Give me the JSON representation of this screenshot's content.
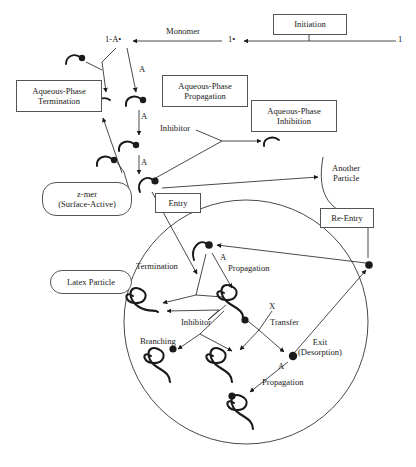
{
  "diagram": {
    "stroke_color": "#1a1a1a",
    "box_border_color": "#555555",
    "background": "#ffffff"
  },
  "boxes": [
    {
      "id": "initiation",
      "label": "Initiation",
      "x": 273,
      "y": 14,
      "w": 72,
      "h": 19,
      "font": 8.6,
      "shape": "rect"
    },
    {
      "id": "aq-term",
      "label": "Aqueous-Phase\nTermination",
      "x": 16,
      "y": 80,
      "w": 84,
      "h": 30,
      "font": 8.6,
      "shape": "rect"
    },
    {
      "id": "aq-prop",
      "label": "Aqueous-Phase\nPropagation",
      "x": 162,
      "y": 75,
      "w": 84,
      "h": 30,
      "font": 8.6,
      "shape": "rect"
    },
    {
      "id": "aq-inhib",
      "label": "Aqueous-Phase\nInhibition",
      "x": 251,
      "y": 100,
      "w": 84,
      "h": 30,
      "font": 8.6,
      "shape": "rect"
    },
    {
      "id": "entry",
      "label": "Entry",
      "x": 155,
      "y": 193,
      "w": 44,
      "h": 18,
      "font": 8.6,
      "shape": "rect"
    },
    {
      "id": "re-entry",
      "label": "Re-Entry",
      "x": 320,
      "y": 208,
      "w": 52,
      "h": 18,
      "font": 8.6,
      "shape": "rect"
    },
    {
      "id": "z-mer",
      "label": "z-mer\n(Surface-Active)",
      "x": 42,
      "y": 182,
      "w": 88,
      "h": 32,
      "font": 8.6,
      "shape": "pill"
    },
    {
      "id": "latex",
      "label": "Latex Particle",
      "x": 50,
      "y": 270,
      "w": 80,
      "h": 22,
      "font": 8.6,
      "shape": "pill"
    }
  ],
  "labels": [
    {
      "id": "monomer",
      "text": "Monomer",
      "x": 166,
      "y": 27,
      "font": 8.6
    },
    {
      "id": "species-1",
      "text": "1",
      "x": 398,
      "y": 41,
      "font": 8.6
    },
    {
      "id": "species-1-rad",
      "text": "1•",
      "x": 228,
      "y": 41,
      "font": 8.6
    },
    {
      "id": "species-1a-rad",
      "text": "1-A•",
      "x": 110,
      "y": 41,
      "font": 8.6
    },
    {
      "id": "mono-a-1",
      "text": "A",
      "x": 139,
      "y": 72,
      "font": 8.6
    },
    {
      "id": "mono-a-2",
      "text": "A",
      "x": 141,
      "y": 116,
      "font": 8.6
    },
    {
      "id": "mono-a-3",
      "text": "A",
      "x": 141,
      "y": 162,
      "font": 8.6
    },
    {
      "id": "inhibitor-aq",
      "text": "Inhibitor",
      "x": 163,
      "y": 128,
      "font": 8.6
    },
    {
      "id": "another-part",
      "text": "Another\nParticle",
      "x": 337,
      "y": 169,
      "font": 8.6
    },
    {
      "id": "termination",
      "text": "Termination",
      "x": 139,
      "y": 266,
      "font": 8.6
    },
    {
      "id": "propagation-1",
      "text": "Propagation",
      "x": 228,
      "y": 268,
      "font": 8.6
    },
    {
      "id": "prop-a-1",
      "text": "A",
      "x": 220,
      "y": 257,
      "font": 8.6
    },
    {
      "id": "inhibitor-part",
      "text": "Inhibitor",
      "x": 185,
      "y": 322,
      "font": 8.6
    },
    {
      "id": "transfer",
      "text": "Transfer",
      "x": 273,
      "y": 322,
      "font": 8.6
    },
    {
      "id": "transfer-x",
      "text": "X",
      "x": 272,
      "y": 307,
      "font": 8.6
    },
    {
      "id": "branching",
      "text": "Branching",
      "x": 144,
      "y": 341,
      "font": 8.6
    },
    {
      "id": "exit",
      "text": "Exit\n(Desorption)",
      "x": 303,
      "y": 343,
      "font": 8.6
    },
    {
      "id": "prop-a-2",
      "text": "A",
      "x": 278,
      "y": 366,
      "font": 8.6
    },
    {
      "id": "propagation-2",
      "text": "Propagation",
      "x": 266,
      "y": 382,
      "font": 8.6
    }
  ],
  "particle": {
    "name": "latex-particle-circle",
    "cx": 246,
    "cy": 322,
    "r": 122
  },
  "another_particle_arc": {
    "name": "another-particle-arc",
    "path": "M 323 157 C 316 196 330 214 366 219"
  },
  "radicals_aqueous": [
    {
      "id": "radical-aq-1",
      "x": 75,
      "y": 60
    },
    {
      "id": "radical-aq-2",
      "x": 101,
      "y": 102
    },
    {
      "id": "radical-aq-3",
      "x": 132,
      "y": 100
    },
    {
      "id": "radical-aq-4",
      "x": 125,
      "y": 145
    },
    {
      "id": "radical-aq-5",
      "x": 104,
      "y": 161
    },
    {
      "id": "radical-aq-6",
      "x": 148,
      "y": 183
    },
    {
      "id": "radical-aq-7",
      "x": 270,
      "y": 141
    }
  ],
  "particle_nodes": [
    {
      "id": "node-entry-particle",
      "x": 207,
      "y": 245
    },
    {
      "id": "node-exit-particle",
      "x": 293,
      "y": 356
    },
    {
      "id": "node-outside",
      "x": 371,
      "y": 265
    }
  ]
}
